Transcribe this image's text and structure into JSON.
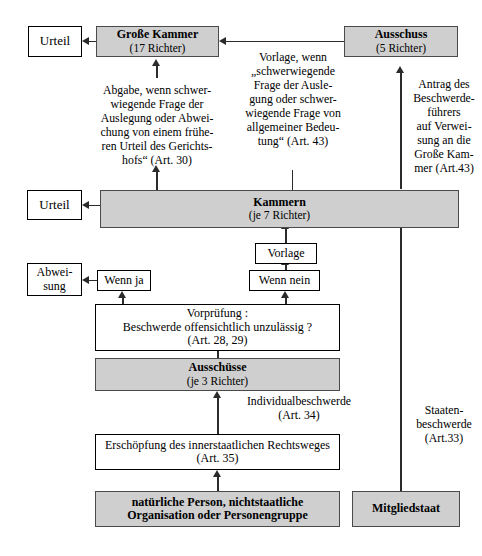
{
  "diagram": {
    "colors": {
      "shaded_fill": "#cfcfcf",
      "line": "#2b2b2b",
      "border": "#000000",
      "background": "#ffffff"
    }
  },
  "nodes": {
    "urteil_top": {
      "label": "Urteil"
    },
    "grosse_kammer": {
      "line1": "Große Kammer",
      "line2": "(17 Richter)"
    },
    "ausschuss": {
      "line1": "Ausschuss",
      "line2": "(5 Richter)"
    },
    "urteil_mid": {
      "label": "Urteil"
    },
    "kammern": {
      "line1": "Kammern",
      "line2": "(je 7 Richter)"
    },
    "vorlage": {
      "label": "Vorlage"
    },
    "wenn_nein": {
      "label": "Wenn nein"
    },
    "wenn_ja": {
      "label": "Wenn ja"
    },
    "abweisung": {
      "line1": "Abwei-",
      "line2": "sung"
    },
    "vorpruefung": {
      "line1": "Vorprüfung :",
      "line2": "Beschwerde offensichtlich unzulässig ?",
      "line3": "(Art. 28, 29)"
    },
    "ausschuesse": {
      "line1": "Ausschüsse",
      "line2": "(je 3 Richter)"
    },
    "erschoepfung": {
      "line1": "Erschöpfung des innerstaatlichen Rechtsweges",
      "line2": "(Art. 35)"
    },
    "person": {
      "line1": "natürliche Person, nichtstaatliche",
      "line2": "Organisation oder Personengruppe"
    },
    "mitgliedstaat": {
      "label": "Mitgliedstaat"
    }
  },
  "edge_labels": {
    "abgabe": "Abgabe, wenn schwer-\nwiegende Frage der\nAuslegung oder Abwei-\nchung von  einem frühe-\nren Urteil des Gerichts-\nhofs“ (Art. 30)",
    "vorlage_gk": "Vorlage, wenn\n„schwerwiegende\nFrage der Ausle-\ngung oder schwer-\nwiegende Frage von\nallgemeiner Bedeu-\ntung“ (Art. 43)",
    "antrag": "Antrag des\nBeschwerde-\nführers\nauf Verwei-\nsung an die\nGroße Kam-\nmer (Art.43)",
    "individualbeschwerde": "Individualbeschwerde\n(Art. 34)",
    "staatenbeschwerde": "Staaten-\nbeschwerde\n(Art.33)"
  }
}
